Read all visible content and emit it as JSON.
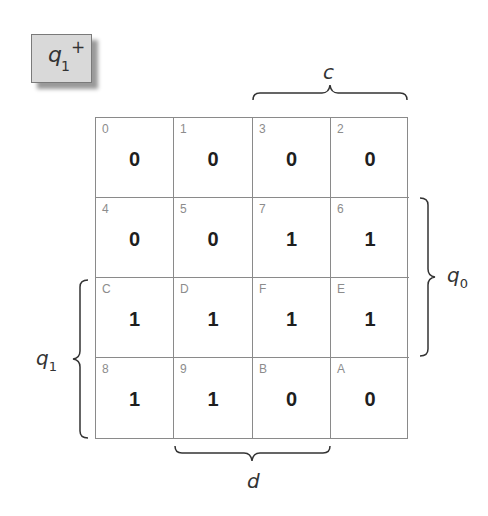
{
  "title": {
    "var": "q",
    "subscript": "1",
    "superscript": "+"
  },
  "kmap": {
    "cells": [
      {
        "index": "0",
        "value": "0"
      },
      {
        "index": "1",
        "value": "0"
      },
      {
        "index": "3",
        "value": "0"
      },
      {
        "index": "2",
        "value": "0"
      },
      {
        "index": "4",
        "value": "0"
      },
      {
        "index": "5",
        "value": "0"
      },
      {
        "index": "7",
        "value": "1"
      },
      {
        "index": "6",
        "value": "1"
      },
      {
        "index": "C",
        "value": "1"
      },
      {
        "index": "D",
        "value": "1"
      },
      {
        "index": "F",
        "value": "1"
      },
      {
        "index": "E",
        "value": "1"
      },
      {
        "index": "8",
        "value": "1"
      },
      {
        "index": "9",
        "value": "1"
      },
      {
        "index": "B",
        "value": "0"
      },
      {
        "index": "A",
        "value": "0"
      }
    ]
  },
  "labels": {
    "c": "c",
    "d": "d",
    "q0": {
      "var": "q",
      "subscript": "0"
    },
    "q1": {
      "var": "q",
      "subscript": "1"
    }
  },
  "colors": {
    "grid_line": "#8a8a8a",
    "title_bg": "#d9d9d9",
    "index_text": "#8c8c8c"
  }
}
